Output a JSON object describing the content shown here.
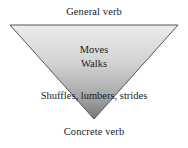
{
  "diagram": {
    "type": "inverted-triangle",
    "title_top": "General verb",
    "title_bottom": "Concrete verb",
    "levels": [
      {
        "text": "Moves"
      },
      {
        "text": "Walks"
      },
      {
        "text": "Shuffles, lumbers, strides"
      }
    ],
    "shape": {
      "fill_top_color": "#ebebeb",
      "fill_bottom_color": "#7e7e7e",
      "stroke_color": "#555555",
      "points": "10,25 178,25 94,119"
    },
    "background_color": "#ffffff",
    "text_color": "#1a1a1a"
  }
}
